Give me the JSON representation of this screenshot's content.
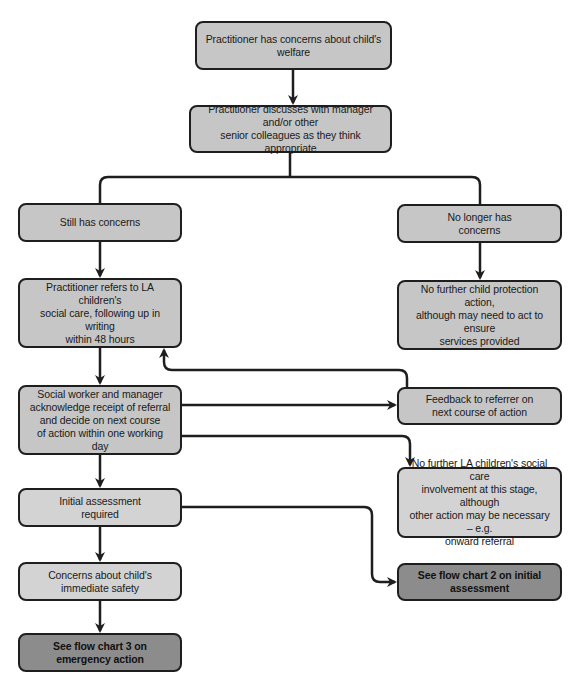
{
  "flowchart": {
    "nodes": {
      "concerns": {
        "label": "Practitioner has concerns about child's welfare"
      },
      "discusses": {
        "label": "Practitioner discusses with manager and/or other\nsenior colleagues as they think appropriate"
      },
      "still_concerns": {
        "label": "Still has concerns"
      },
      "no_longer": {
        "label": "No longer has\nconcerns"
      },
      "refers": {
        "label": "Practitioner refers to LA children's\nsocial care, following up in writing\nwithin 48 hours"
      },
      "no_further_cp": {
        "label": "No further child protection action,\nalthough may need to act to ensure\nservices provided"
      },
      "social_worker": {
        "label": "Social worker and manager\nacknowledge receipt of referral\nand decide on next course\nof action within one working day"
      },
      "feedback": {
        "label": "Feedback to referrer on\nnext course of action"
      },
      "no_further_la": {
        "label": "No further LA children's social care\ninvolvement at this stage, although\nother action may be necessary – e.g.\nonward referral"
      },
      "initial_assessment": {
        "label": "Initial assessment\nrequired"
      },
      "immediate_safety": {
        "label": "Concerns about child's\nimmediate safety"
      },
      "flow_chart_3": {
        "label": "See flow chart 3 on\nemergency action"
      },
      "flow_chart_2": {
        "label": "See flow chart 2 on initial\nassessment"
      }
    },
    "edges": [
      {
        "from": "concerns",
        "to": "discusses"
      },
      {
        "from": "discusses",
        "to": "still_concerns"
      },
      {
        "from": "discusses",
        "to": "no_longer"
      },
      {
        "from": "still_concerns",
        "to": "refers"
      },
      {
        "from": "no_longer",
        "to": "no_further_cp"
      },
      {
        "from": "refers",
        "to": "social_worker"
      },
      {
        "from": "social_worker",
        "to": "feedback"
      },
      {
        "from": "feedback",
        "to": "refers"
      },
      {
        "from": "social_worker",
        "to": "no_further_la"
      },
      {
        "from": "social_worker",
        "to": "initial_assessment"
      },
      {
        "from": "initial_assessment",
        "to": "immediate_safety"
      },
      {
        "from": "initial_assessment",
        "to": "flow_chart_2"
      },
      {
        "from": "immediate_safety",
        "to": "flow_chart_3"
      }
    ],
    "colors": {
      "box_fill": "#c6c6c6",
      "box_fill_light": "#d3d3d3",
      "box_fill_dark": "#8c8c8c",
      "stroke": "#1e1e1e"
    }
  }
}
